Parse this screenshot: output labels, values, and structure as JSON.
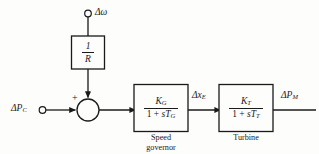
{
  "diagram": {
    "background_color": "#fdfdfc",
    "line_color": "#1a1a1a",
    "inputs": {
      "command_input_label": "ΔP",
      "command_input_sub": "C",
      "speed_input_label": "Δω"
    },
    "summing_junction": {
      "plus_sign": "+",
      "minus_sign": "−"
    },
    "feedback_block": {
      "numerator": "1",
      "denominator": "R"
    },
    "blocks": [
      {
        "name": "speed-governor",
        "numerator": "K",
        "numerator_sub": "G",
        "denominator_prefix": "1 + ",
        "denominator_s": "s",
        "denominator_T": "T",
        "denominator_sub": "G",
        "caption_line1": "Speed",
        "caption_line2": "governor"
      },
      {
        "name": "turbine",
        "numerator": "K",
        "numerator_sub": "T",
        "denominator_prefix": "1 + ",
        "denominator_s": "s",
        "denominator_T": "T",
        "denominator_sub": "T",
        "caption_line1": "Turbine",
        "caption_line2": ""
      }
    ],
    "signals": {
      "governor_output_label": "Δx",
      "governor_output_sub": "E",
      "turbine_output_label": "ΔP",
      "turbine_output_sub": "M"
    }
  }
}
